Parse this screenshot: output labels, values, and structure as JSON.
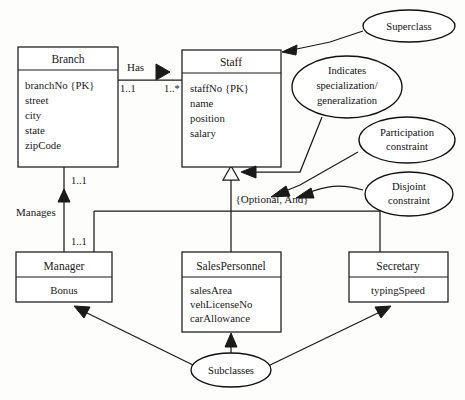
{
  "diagram": {
    "type": "uml-class-diagram",
    "classes": [
      {
        "id": "branch",
        "name": "Branch",
        "attributes": [
          "branchNo {PK}",
          "street",
          "city",
          "state",
          "zipCode"
        ],
        "align": "left"
      },
      {
        "id": "staff",
        "name": "Staff",
        "attributes": [
          "staffNo {PK}",
          "name",
          "position",
          "salary"
        ],
        "align": "left"
      },
      {
        "id": "manager",
        "name": "Manager",
        "attributes": [
          "Bonus"
        ],
        "align": "center"
      },
      {
        "id": "salespersonnel",
        "name": "SalesPersonnel",
        "attributes": [
          "salesArea",
          "vehLicenseNo",
          "carAllowance"
        ],
        "align": "left"
      },
      {
        "id": "secretary",
        "name": "Secretary",
        "attributes": [
          "typingSpeed"
        ],
        "align": "center"
      }
    ],
    "associations": [
      {
        "id": "has",
        "label": "Has",
        "direction_marker": "filled-triangle-right",
        "source_multiplicity": "1..1",
        "target_multiplicity": "1..*"
      },
      {
        "id": "manages",
        "label": "Manages",
        "direction_marker": "filled-triangle-up",
        "source_multiplicity": "1..1",
        "target_multiplicity": "1..1"
      }
    ],
    "generalization": {
      "constraint_label": "{Optional, And}",
      "marker": "hollow-triangle"
    },
    "callouts": [
      {
        "id": "superclass",
        "lines": [
          "Superclass"
        ]
      },
      {
        "id": "specialization",
        "lines": [
          "Indicates",
          "specialization/",
          "generalization"
        ]
      },
      {
        "id": "participation",
        "lines": [
          "Participation",
          "constraint"
        ]
      },
      {
        "id": "disjoint",
        "lines": [
          "Disjoint",
          "constraint"
        ]
      },
      {
        "id": "subclasses",
        "lines": [
          "Subclasses"
        ]
      }
    ],
    "colors": {
      "stroke": "#1a1a1a",
      "fill": "#ffffff",
      "background": "#fdfdfc"
    }
  }
}
